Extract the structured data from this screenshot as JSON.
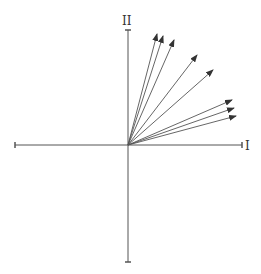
{
  "diagram": {
    "type": "vector-diagram",
    "origin": [
      128,
      145
    ],
    "axes": {
      "horizontal": {
        "label": "I",
        "from": [
          15,
          145
        ],
        "to": [
          242,
          145
        ]
      },
      "vertical": {
        "label": "II",
        "from": [
          128,
          262
        ],
        "to": [
          128,
          30
        ]
      }
    },
    "vectors": [
      {
        "id": 1,
        "tip": [
          157,
          34
        ]
      },
      {
        "id": 2,
        "tip": [
          163,
          36
        ]
      },
      {
        "id": 3,
        "tip": [
          174,
          40
        ]
      },
      {
        "id": 4,
        "tip": [
          197,
          55
        ]
      },
      {
        "id": 5,
        "tip": [
          213,
          70
        ]
      },
      {
        "id": 6,
        "tip": [
          232,
          100
        ]
      },
      {
        "id": 7,
        "tip": [
          234,
          108
        ]
      },
      {
        "id": 8,
        "tip": [
          236,
          116
        ]
      }
    ],
    "colors": {
      "line": "#555555",
      "arrowhead": "#333333",
      "background": "#ffffff"
    }
  }
}
